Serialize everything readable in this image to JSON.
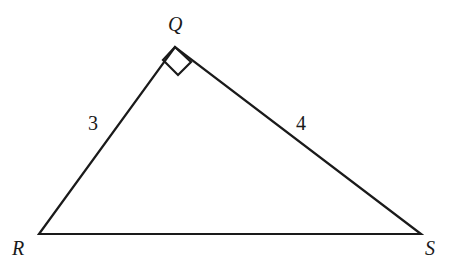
{
  "figure": {
    "kind": "right-triangle-diagram",
    "background_color": "#ffffff",
    "stroke_color": "#1a1a1a",
    "stroke_width": 2.2,
    "canvas": {
      "width": 458,
      "height": 272
    },
    "vertices": [
      {
        "name": "Q",
        "label": "Q",
        "x": 175,
        "y": 47
      },
      {
        "name": "R",
        "label": "R",
        "x": 39,
        "y": 234
      },
      {
        "name": "S",
        "label": "S",
        "x": 421,
        "y": 234
      }
    ],
    "sides": [
      {
        "name": "RQ",
        "label": "3",
        "from": "R",
        "to": "Q"
      },
      {
        "name": "QS",
        "label": "4",
        "from": "Q",
        "to": "S"
      },
      {
        "name": "RS",
        "label": "",
        "from": "R",
        "to": "S"
      }
    ],
    "right_angle": {
      "at_vertex": "Q",
      "marker": "square",
      "points": "175,47 163,60 178,75 191,62"
    },
    "outline_points": "39,234 175,47 421,234"
  }
}
